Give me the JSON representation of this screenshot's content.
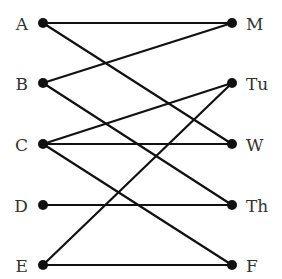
{
  "diagram": {
    "type": "bipartite-graph",
    "left_nodes": [
      {
        "id": "A",
        "label": "A",
        "x": 43,
        "y": 23
      },
      {
        "id": "B",
        "label": "B",
        "x": 43,
        "y": 83
      },
      {
        "id": "C",
        "label": "C",
        "x": 43,
        "y": 144
      },
      {
        "id": "D",
        "label": "D",
        "x": 43,
        "y": 205
      },
      {
        "id": "E",
        "label": "E",
        "x": 43,
        "y": 265
      }
    ],
    "right_nodes": [
      {
        "id": "M",
        "label": "M",
        "x": 232,
        "y": 23
      },
      {
        "id": "Tu",
        "label": "Tu",
        "x": 232,
        "y": 83
      },
      {
        "id": "W",
        "label": "W",
        "x": 232,
        "y": 144
      },
      {
        "id": "Th",
        "label": "Th",
        "x": 232,
        "y": 205
      },
      {
        "id": "F",
        "label": "F",
        "x": 232,
        "y": 265
      }
    ],
    "edges": [
      [
        "A",
        "M"
      ],
      [
        "A",
        "W"
      ],
      [
        "B",
        "M"
      ],
      [
        "B",
        "Th"
      ],
      [
        "C",
        "Tu"
      ],
      [
        "C",
        "W"
      ],
      [
        "C",
        "F"
      ],
      [
        "D",
        "Th"
      ],
      [
        "E",
        "Tu"
      ],
      [
        "E",
        "F"
      ]
    ],
    "colors": {
      "edge": "#111111",
      "node": "#111111",
      "label": "#333333",
      "background": "#ffffff"
    }
  }
}
